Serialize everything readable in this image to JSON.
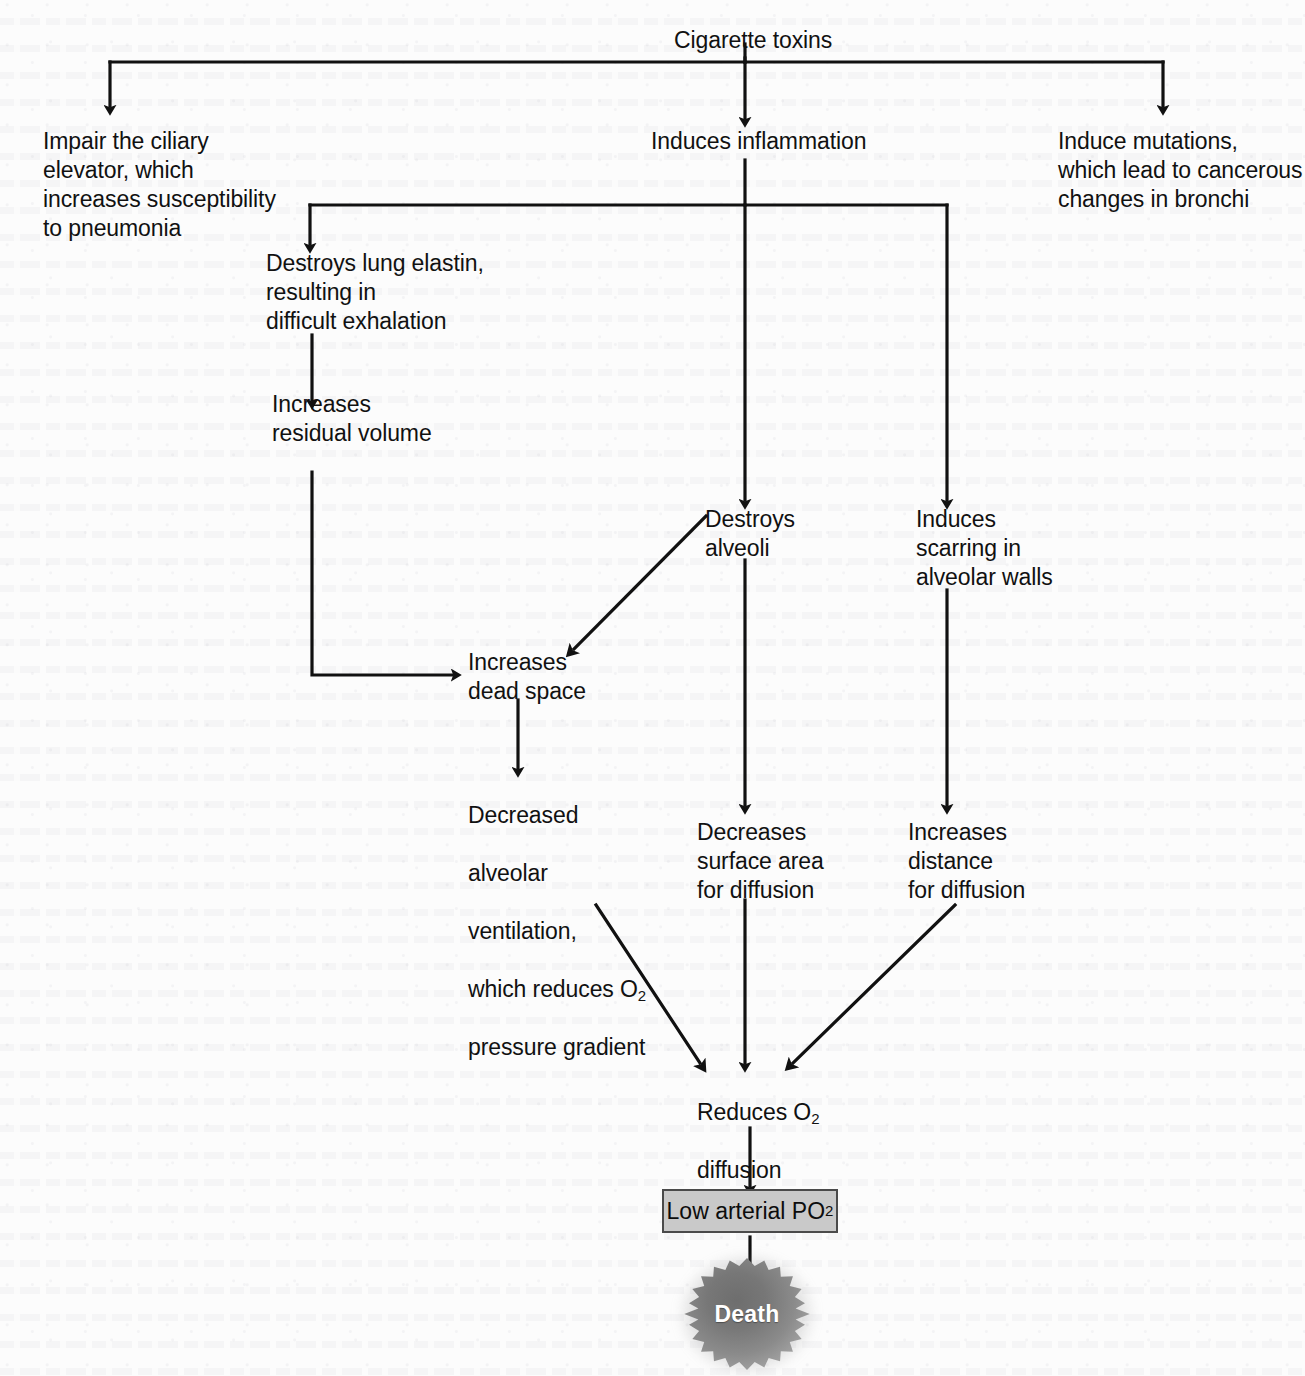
{
  "diagram": {
    "type": "flowchart",
    "ink_color": "#111111",
    "box_fill_color": "#c9c9c9",
    "box_border_color": "#4a4a4a",
    "burst_color": "#8b8b8b",
    "burst_label_color": "#ffffff"
  },
  "nodes": {
    "root": {
      "label": "Cigarette toxins"
    },
    "ciliary": {
      "label": "Impair the ciliary\nelevator, which\nincreases susceptibility\nto pneumonia"
    },
    "inflammation": {
      "label": "Induces inflammation"
    },
    "mutations": {
      "label": "Induce mutations,\nwhich lead to cancerous\nchanges in bronchi"
    },
    "elastin": {
      "label": "Destroys lung elastin,\nresulting in\ndifficult exhalation"
    },
    "residual": {
      "label": "Increases\nresidual volume"
    },
    "alveoli": {
      "label": "Destroys\nalveoli"
    },
    "scarring": {
      "label": "Induces\nscarring in\nalveolar walls"
    },
    "deadspace": {
      "label": "Increases\ndead space"
    },
    "ventilation_line1": "Decreased",
    "ventilation_line2": "alveolar",
    "ventilation_line3": "ventilation,",
    "ventilation_line4_pre": "which reduces O",
    "ventilation_line4_sub": "2",
    "ventilation_line5": "pressure gradient",
    "surface": {
      "label": "Decreases\nsurface area\nfor diffusion"
    },
    "distance": {
      "label": "Increases\ndistance\nfor diffusion"
    },
    "reduces_pre": "Reduces O",
    "reduces_sub": "2",
    "reduces_line2": "diffusion",
    "po2_pre": "Low arterial PO",
    "po2_sub": "2",
    "death": {
      "label": "Death"
    }
  }
}
